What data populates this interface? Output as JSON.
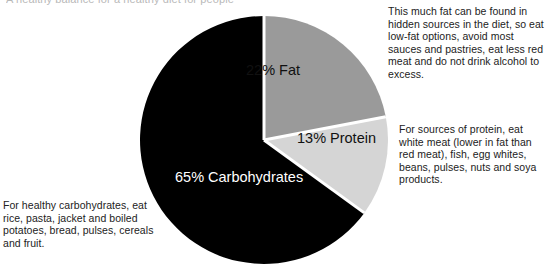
{
  "document": {
    "clipped_heading": "A healthy balance for a healthy diet for people"
  },
  "chart_data": {
    "type": "pie",
    "title": "",
    "legend_position": "on-slice",
    "start_angle_deg": 0,
    "direction": "clockwise",
    "categories": [
      "Fat",
      "Protein",
      "Carbohydrates"
    ],
    "values": [
      22,
      13,
      65
    ],
    "unit": "%",
    "slices": [
      {
        "name": "Fat",
        "value": 22,
        "label": "22% Fat",
        "color": "#9a9a9a",
        "label_color": "#111111"
      },
      {
        "name": "Protein",
        "value": 13,
        "label": "13% Protein",
        "color": "#d5d5d5",
        "label_color": "#111111"
      },
      {
        "name": "Carbohydrates",
        "value": 65,
        "label": "65% Carbohydrates",
        "color": "#000000",
        "label_color": "#ffffff"
      }
    ],
    "separator_color": "#ffffff",
    "annotations": [
      {
        "for": "Fat",
        "text": "This much fat can be found in hidden sources in the diet, so eat low-fat options, avoid most sauces and pastries, eat less red meat and do not drink alcohol to excess."
      },
      {
        "for": "Protein",
        "text": "For sources of protein, eat white meat (lower in fat than red meat), fish, egg whites, beans, pulses, nuts and soya products."
      },
      {
        "for": "Carbohydrates",
        "text": "For healthy carbohydrates, eat rice, pasta, jacket and boiled potatoes, bread, pulses, cereals and fruit."
      }
    ]
  },
  "colors": {
    "background": "#ffffff",
    "fat": "#9a9a9a",
    "protein": "#d5d5d5",
    "carbohydrates": "#000000",
    "text": "#222222",
    "separator": "#ffffff"
  }
}
